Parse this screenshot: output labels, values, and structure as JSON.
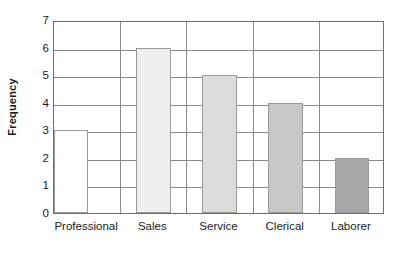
{
  "chart_data": {
    "type": "bar",
    "title": "",
    "xlabel": "",
    "ylabel": "Frequency",
    "categories": [
      "Professional",
      "Sales",
      "Service",
      "Clerical",
      "Laborer"
    ],
    "values": [
      3,
      6,
      5,
      4,
      2
    ],
    "ylim": [
      0,
      7
    ],
    "yticks": [
      0,
      1,
      2,
      3,
      4,
      5,
      6,
      7
    ],
    "ytick_labels": [
      "0",
      "1",
      "2",
      "3",
      "4",
      "5",
      "6",
      "7"
    ],
    "grid": "horizontal",
    "legend": "none",
    "bar_colors": [
      "#FFFFFF",
      "#EFEFEF",
      "#DCDCDC",
      "#C8C8C8",
      "#A8A8A8"
    ],
    "bar_edge_color": "#9A9A9A",
    "axis_color": "#6E6E6E",
    "grid_color": "#8A8A8A",
    "text_color": "#1A1A1A",
    "background_color": "#FFFFFF"
  }
}
